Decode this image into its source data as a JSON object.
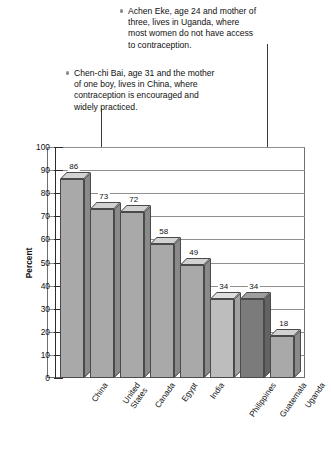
{
  "annotations": [
    {
      "id": "uganda",
      "bullet": "round-bullet",
      "lines": [
        "Achen Eke, age 24 and mother of",
        "three, lives in Uganda, where",
        "most women do not have access",
        "to contraception."
      ],
      "points_to": "Uganda"
    },
    {
      "id": "china",
      "bullet": "round-bullet",
      "lines": [
        "Chen-chi Bai, age 31 and the mother",
        "of one boy, lives in China, where",
        "contraception is encouraged and",
        "widely practiced."
      ],
      "points_to": "China"
    }
  ],
  "chart_data": {
    "type": "bar",
    "title": "",
    "xlabel": "",
    "ylabel": "Percent",
    "ylim": [
      0,
      100
    ],
    "yticks": [
      0,
      10,
      20,
      30,
      40,
      50,
      60,
      70,
      80,
      90,
      100
    ],
    "grid": true,
    "legend": "none",
    "categories": [
      "China",
      "United States",
      "Canada",
      "Egypt",
      "India",
      "Philippines",
      "Guatemala",
      "Uganda"
    ],
    "category_lines": [
      [
        "China"
      ],
      [
        "United",
        "States"
      ],
      [
        "Canada"
      ],
      [
        "Egypt"
      ],
      [
        "India"
      ],
      [
        "Philippines"
      ],
      [
        "Guatemala"
      ],
      [
        "Uganda"
      ]
    ],
    "values": [
      86,
      73,
      72,
      58,
      49,
      34,
      34,
      18
    ],
    "bar_shades": [
      "mid",
      "mid",
      "mid",
      "mid",
      "mid",
      "light",
      "dark",
      "mid"
    ]
  },
  "colors": {
    "bar_mid": "#a9a9a9",
    "bar_dark": "#7b7b7b",
    "bar_light": "#bdbdbd",
    "grid": "#8f8f8f",
    "axis": "#2b2b2b",
    "text": "#111111",
    "background": "#ffffff"
  }
}
